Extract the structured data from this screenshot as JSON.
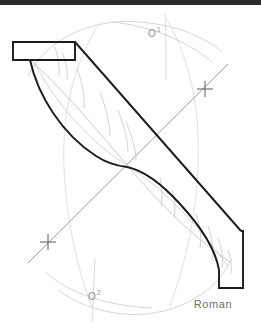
{
  "canvas": {
    "width": 261,
    "height": 334,
    "background": "#ffffff",
    "top_bar_color": "#2b2b2b"
  },
  "drawing": {
    "title": "twisted-ribbon-geometric-construction",
    "description": "Hand-drafted S-shaped twisted band with compass construction arcs",
    "ink_color": "#1a1a1a",
    "construction_color": "#b9b9bf",
    "light_construction_color": "#cfcfd4",
    "outline_stroke_width": 2,
    "construction_stroke_width": 0.7
  },
  "labels": {
    "center_upper": {
      "text": "O",
      "superscript": "1",
      "x": 148,
      "y": 37
    },
    "center_lower": {
      "text": "O",
      "superscript": "2",
      "x": 88,
      "y": 300
    }
  },
  "signature": {
    "text": "Roman",
    "x": 213,
    "y": 308
  },
  "tick_marks": [
    {
      "name": "tick-upper-right",
      "x": 205,
      "y": 89
    },
    {
      "name": "tick-lower-left",
      "x": 48,
      "y": 242
    }
  ],
  "key_points": {
    "crossing_center": {
      "x": 127,
      "y": 165
    },
    "top_left_notch": {
      "x": 13,
      "y": 42,
      "width": 62,
      "height": 18
    },
    "bottom_right_notch": {
      "x": 211,
      "y": 268,
      "width": 32,
      "height": 20
    }
  },
  "geometry": {
    "band_outer_top": "M30,60 L30,42 L75,42 L75,60 Z",
    "arc_upper_label_tick": "vertical construction line through O1",
    "arc_lower_label_tick": "vertical construction line through O2"
  }
}
